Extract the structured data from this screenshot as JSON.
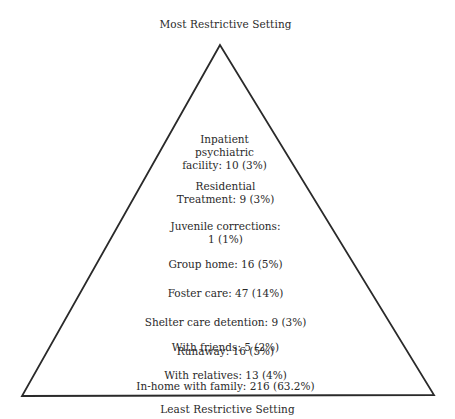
{
  "diagram": {
    "top_label": "Most Restrictive Setting",
    "bottom_label": "Least Restrictive Setting",
    "levels": [
      {
        "lines": [
          "Inpatient",
          "psychiatric",
          "facility:  10 (3%)"
        ],
        "setting": "Inpatient psychiatric facility",
        "count": 10,
        "percent": "3%"
      },
      {
        "lines": [
          "Residential",
          "Treatment:  9 (3%)"
        ],
        "setting": "Residential Treatment",
        "count": 9,
        "percent": "3%"
      },
      {
        "lines": [
          "Juvenile corrections:",
          "1 (1%)"
        ],
        "setting": "Juvenile corrections",
        "count": 1,
        "percent": "1%"
      },
      {
        "lines": [
          "Group home:  16 (5%)"
        ],
        "setting": "Group home",
        "count": 16,
        "percent": "5%"
      },
      {
        "lines": [
          "Foster care:  47 (14%)"
        ],
        "setting": "Foster care",
        "count": 47,
        "percent": "14%"
      },
      {
        "lines": [
          "Shelter care detention:  9 (3%)"
        ],
        "setting": "Shelter care detention",
        "count": 9,
        "percent": "3%"
      },
      {
        "lines": [
          "Runaway:  16 (5%)"
        ],
        "setting": "Runaway",
        "count": 16,
        "percent": "5%"
      },
      {
        "lines": [
          "With friends:  5 (2%)"
        ],
        "setting": "With friends",
        "count": 5,
        "percent": "2%"
      },
      {
        "lines": [
          "With relatives:  13 (4%)"
        ],
        "setting": "With relatives",
        "count": 13,
        "percent": "4%"
      },
      {
        "lines": [
          "In-home with family:  216 (63.2%)"
        ],
        "setting": "In-home with family",
        "count": 216,
        "percent": "63.2%"
      }
    ],
    "colors": {
      "stroke": "#2a2a2a",
      "text": "#2a2a2a",
      "background": "#ffffff"
    }
  }
}
